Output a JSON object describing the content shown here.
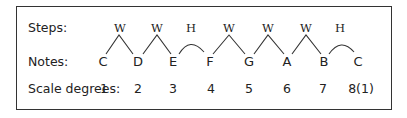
{
  "diagram": {
    "row_labels": {
      "steps": "Steps:",
      "notes": "Notes:",
      "scale_degrees": "Scale degrees:"
    },
    "notes": [
      "C",
      "D",
      "E",
      "F",
      "G",
      "A",
      "B",
      "C"
    ],
    "steps": [
      "W",
      "W",
      "H",
      "W",
      "W",
      "W",
      "H"
    ],
    "scale_degrees": [
      "1",
      "2",
      "3",
      "4",
      "5",
      "6",
      "7",
      "8(1)"
    ]
  }
}
